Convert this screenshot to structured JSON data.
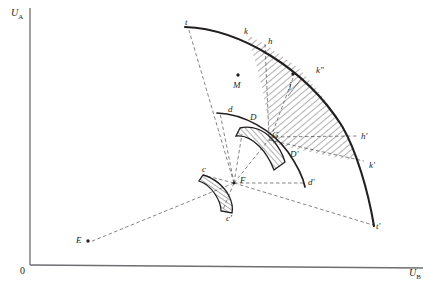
{
  "figure": {
    "type": "geometric-diagram",
    "background_color": "#ffffff",
    "line_color": "#231f20",
    "axes": {
      "y_label": "U",
      "y_label_sub": "A",
      "x_label": "U",
      "x_label_sub": "B",
      "origin_label": "0",
      "x_axis_color": "#6d6e71",
      "y_axis_color": "#6d6e71"
    },
    "labels": [
      {
        "id": "t",
        "text": "t",
        "x": 185,
        "y": 18
      },
      {
        "id": "k",
        "text": "k",
        "x": 244,
        "y": 27
      },
      {
        "id": "h",
        "text": "h",
        "x": 268,
        "y": 37
      },
      {
        "id": "k2",
        "text": "k\"",
        "x": 316,
        "y": 66
      },
      {
        "id": "M",
        "text": "M",
        "x": 233,
        "y": 81
      },
      {
        "id": "j",
        "text": "j",
        "x": 289,
        "y": 81
      },
      {
        "id": "d",
        "text": "d",
        "x": 228,
        "y": 105
      },
      {
        "id": "D",
        "text": "D",
        "x": 250,
        "y": 113
      },
      {
        "id": "G",
        "text": "G",
        "x": 272,
        "y": 131
      },
      {
        "id": "Dp",
        "text": "D'",
        "x": 290,
        "y": 150
      },
      {
        "id": "hp",
        "text": "h'",
        "x": 361,
        "y": 132
      },
      {
        "id": "kp",
        "text": "k'",
        "x": 369,
        "y": 161
      },
      {
        "id": "dp",
        "text": "d'",
        "x": 308,
        "y": 178
      },
      {
        "id": "tp",
        "text": "t'",
        "x": 376,
        "y": 222
      },
      {
        "id": "F",
        "text": "F",
        "x": 240,
        "y": 176
      },
      {
        "id": "c",
        "text": "c",
        "x": 202,
        "y": 168
      },
      {
        "id": "cp",
        "text": "c'",
        "x": 226,
        "y": 214
      },
      {
        "id": "E",
        "text": "E",
        "x": 76,
        "y": 236
      }
    ],
    "points": [
      {
        "id": "M",
        "x": 238,
        "y": 77
      },
      {
        "id": "j",
        "x": 293,
        "y": 76
      },
      {
        "id": "E",
        "x": 88,
        "y": 242
      },
      {
        "id": "F",
        "x": 234,
        "y": 183
      }
    ],
    "curves": {
      "outer_arc": {
        "from": "t",
        "to": "t'",
        "stroke_width": 2.0
      },
      "middle_arc": {
        "from": "d",
        "to": "d'",
        "stroke_width": 1.6
      },
      "band_large": {
        "from": "k",
        "to": "k'",
        "hatched": true
      },
      "band_middle": {
        "from": "D",
        "to": "D'",
        "hatched": true
      },
      "band_small": {
        "from": "c",
        "to": "c'",
        "hatched": true
      }
    },
    "hatch": {
      "color": "#231f20",
      "spacing_px": 4,
      "angle_deg": 45
    }
  }
}
